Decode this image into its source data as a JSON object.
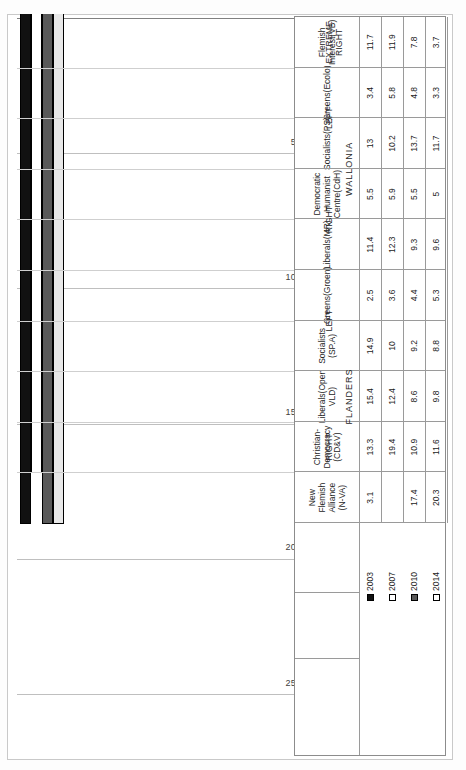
{
  "chart_data": {
    "type": "bar",
    "orientation": "horizontal",
    "title": "",
    "xlabel": "",
    "ylabel": "",
    "xlim": [
      0,
      25
    ],
    "xticks": [
      "0",
      "5",
      "10",
      "15",
      "20",
      "25"
    ],
    "grid": true,
    "legend_position": "table-left",
    "categories": [
      "New Flemish Alliance (N-VA)",
      "Christian-Democracy (CD&V)",
      "Liberals(Open VLD)",
      "Socialists (SP.A)",
      "Greens(Groen)",
      "Liberals(MR)",
      "Democratic Humanist Centre(CdH)",
      "Socialists(PS)",
      "Greens(Ecolo)",
      "Flemish Interest(VB)"
    ],
    "series": [
      {
        "name": "2003",
        "values": [
          3.1,
          13.3,
          15.4,
          14.9,
          2.5,
          11.4,
          5.5,
          13,
          3.4,
          11.7
        ]
      },
      {
        "name": "2007",
        "values": [
          null,
          19.4,
          12.4,
          10,
          3.6,
          12.3,
          5.9,
          10.2,
          5.8,
          11.9
        ]
      },
      {
        "name": "2010",
        "values": [
          17.4,
          10.9,
          8.6,
          9.2,
          4.4,
          9.3,
          5.5,
          13.7,
          4.8,
          7.8
        ]
      },
      {
        "name": "2014",
        "values": [
          20.3,
          11.6,
          9.8,
          8.8,
          5.3,
          9.6,
          5,
          11.7,
          3.3,
          3.7
        ]
      }
    ],
    "series_colors": [
      "#111111",
      "#ffffff",
      "#595959",
      "#e8e8e8"
    ]
  },
  "axis": {
    "ticks": [
      {
        "label": "0",
        "value": 0
      },
      {
        "label": "5",
        "value": 5
      },
      {
        "label": "10",
        "value": 10
      },
      {
        "label": "15",
        "value": 15
      },
      {
        "label": "20",
        "value": 20
      },
      {
        "label": "25",
        "value": 25
      }
    ]
  },
  "legend": {
    "items": [
      {
        "label": "2003",
        "swatch": "filled-black"
      },
      {
        "label": "2007",
        "swatch": "outline-white"
      },
      {
        "label": "2010",
        "swatch": "filled-gray"
      },
      {
        "label": "2014",
        "swatch": "outline-white"
      }
    ]
  },
  "table": {
    "row_labels": [
      "2003",
      "2007",
      "2010",
      "2014"
    ],
    "parties": [
      {
        "name": "New Flemish\nAlliance\n(N-VA)",
        "wing": "RIGHT",
        "region": "FLANDERS",
        "values": [
          "3.1",
          "",
          "17.4",
          "20.3"
        ]
      },
      {
        "name": "Christian-\nDemocracy\n(CD&V)",
        "wing": "RIGHT",
        "region": "FLANDERS",
        "values": [
          "13.3",
          "19.4",
          "10.9",
          "11.6"
        ]
      },
      {
        "name": "Liberals(Open\nVLD)",
        "wing": "RIGHT",
        "region": "FLANDERS",
        "values": [
          "15.4",
          "12.4",
          "8.6",
          "9.8"
        ]
      },
      {
        "name": "Socialists\n(SP.A)",
        "wing": "LEFT",
        "region": "FLANDERS",
        "values": [
          "14.9",
          "10",
          "9.2",
          "8.8"
        ]
      },
      {
        "name": "Greens(Groen)",
        "wing": "LEFT",
        "region": "FLANDERS",
        "values": [
          "2.5",
          "3.6",
          "4.4",
          "5.3"
        ]
      },
      {
        "name": "Liberals(MR)",
        "wing": "RIGHT",
        "region": "WALLONIA",
        "values": [
          "11.4",
          "12.3",
          "9.3",
          "9.6"
        ]
      },
      {
        "name": "Democratic\nHumanist\nCentre(CdH)",
        "wing": "RIGHT",
        "region": "WALLONIA",
        "values": [
          "5.5",
          "5.9",
          "5.5",
          "5"
        ]
      },
      {
        "name": "Socialists(PS)",
        "wing": "LEFT",
        "region": "WALLONIA",
        "values": [
          "13",
          "10.2",
          "13.7",
          "11.7"
        ]
      },
      {
        "name": "Greens(Ecolo)",
        "wing": "LEFT",
        "region": "WALLONIA",
        "values": [
          "3.4",
          "5.8",
          "4.8",
          "3.3"
        ]
      },
      {
        "name": "Flemish\nInterest(VB)",
        "wing": "EXTREME\nRIGHT",
        "region": "",
        "values": [
          "11.7",
          "11.9",
          "7.8",
          "3.7"
        ]
      }
    ],
    "wing_groups": [
      {
        "label": "RIGHT",
        "start": 0,
        "end": 2
      },
      {
        "label": "LEFT",
        "start": 3,
        "end": 4
      },
      {
        "label": "RIGHT",
        "start": 5,
        "end": 6
      },
      {
        "label": "LEFT",
        "start": 7,
        "end": 8
      },
      {
        "label": "EXTREME\nRIGHT",
        "start": 9,
        "end": 9
      }
    ],
    "region_groups": [
      {
        "label": "FLANDERS",
        "start": 0,
        "end": 4
      },
      {
        "label": "WALLONIA",
        "start": 5,
        "end": 8
      }
    ]
  }
}
